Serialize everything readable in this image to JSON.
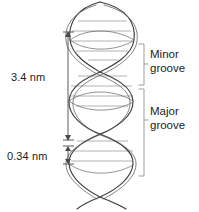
{
  "figure": {
    "background_color": "#ffffff"
  },
  "measurements": [
    {
      "id": "helix-pitch",
      "label": "3.4 nm",
      "description": "full helical turn pitch",
      "bracket_top_y": 32,
      "bracket_bottom_y": 140
    },
    {
      "id": "base-pair-rise",
      "label": "0.34 nm",
      "description": "rise per base pair",
      "bracket_top_y": 146,
      "bracket_bottom_y": 164
    }
  ],
  "grooves": [
    {
      "id": "minor-groove",
      "line1": "Minor",
      "line2": "groove",
      "bracket_top_y": 44,
      "bracket_bottom_y": 85
    },
    {
      "id": "major-groove",
      "line1": "Major",
      "line2": "groove",
      "bracket_top_y": 88,
      "bracket_bottom_y": 176
    }
  ],
  "colors": {
    "strand_stroke": "#3a3a3a",
    "rung_stroke": "#9a9a9a",
    "bracket_stroke": "#9d9d9d",
    "arrow_stroke": "#4a4a4a",
    "text": "#1c1c1c"
  },
  "helix": {
    "strand_count": 2,
    "turns": 3,
    "base_pair_rungs": 11
  }
}
